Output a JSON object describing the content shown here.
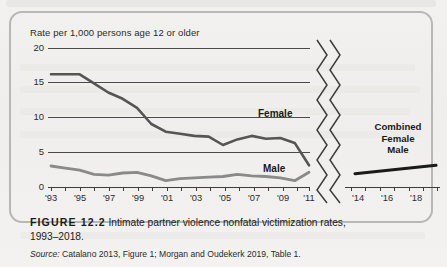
{
  "figure": {
    "number_label": "FIGURE 12.2",
    "caption": "Intimate partner violence nonfatal victimization rates, 1993–2018.",
    "source_prefix": "Source:",
    "source_text": "Catalano 2013, Figure 1; Morgan and Oudekerk 2019, Table 1."
  },
  "chart_data": {
    "type": "line",
    "title": "Intimate partner violence nonfatal victimization rates, 1993–2018",
    "ylabel": "Rate per 1,000 persons age 12 or older",
    "xlabel": "",
    "ylim": [
      0,
      20
    ],
    "yticks": [
      0,
      5,
      10,
      15,
      20
    ],
    "ytick_labels": [
      "0",
      "5",
      "10",
      "15",
      "20"
    ],
    "grid": true,
    "axis_break": true,
    "axis_break_note": "x-axis broken between 2011 and 2014",
    "xticks_left": [
      1993,
      1995,
      1997,
      1999,
      2001,
      2003,
      2005,
      2007,
      2009,
      2011
    ],
    "xtick_labels_left": [
      "'93",
      "'95",
      "'97",
      "'99",
      "'01",
      "'03",
      "'05",
      "'07",
      "'09",
      "'11"
    ],
    "xticks_right": [
      2014,
      2016,
      2018
    ],
    "xtick_labels_right": [
      "'14",
      "'16",
      "'18"
    ],
    "legend_position": "inline-right",
    "series": [
      {
        "name": "Female",
        "color": "#555555",
        "segment": "left",
        "x": [
          1993,
          1994,
          1995,
          1996,
          1997,
          1998,
          1999,
          2000,
          2001,
          2002,
          2003,
          2004,
          2005,
          2006,
          2007,
          2008,
          2009,
          2010,
          2011
        ],
        "values": [
          16.1,
          16.1,
          16.1,
          14.8,
          13.5,
          12.6,
          11.3,
          9.0,
          7.9,
          7.6,
          7.3,
          7.2,
          6.0,
          6.8,
          7.3,
          6.9,
          7.0,
          6.3,
          3.1
        ]
      },
      {
        "name": "Male",
        "color": "#8a8a8a",
        "segment": "left",
        "x": [
          1993,
          1994,
          1995,
          1996,
          1997,
          1998,
          1999,
          2000,
          2001,
          2002,
          2003,
          2004,
          2005,
          2006,
          2007,
          2008,
          2009,
          2010,
          2011
        ],
        "values": [
          3.0,
          2.7,
          2.4,
          1.8,
          1.7,
          2.0,
          2.1,
          1.6,
          0.9,
          1.2,
          1.3,
          1.4,
          1.5,
          1.8,
          1.6,
          1.5,
          1.3,
          0.9,
          2.1
        ]
      },
      {
        "name": "Combined Female Male",
        "color": "#1a1a1a",
        "segment": "right",
        "x": [
          2014,
          2018
        ],
        "values": [
          1.9,
          3.1
        ]
      }
    ],
    "annotations": [
      {
        "text": "Female",
        "x": 2009,
        "y": 8.7
      },
      {
        "text": "Male",
        "x": 2009,
        "y": 2.8
      },
      {
        "text": "Combined",
        "x": 2016,
        "y": 7.3
      },
      {
        "text": "Female",
        "x": 2016,
        "y": 6.1
      },
      {
        "text": "Male",
        "x": 2016,
        "y": 4.9
      }
    ]
  },
  "labels": {
    "female": "Female",
    "male": "Male",
    "combined_line1": "Combined",
    "combined_line2": "Female",
    "combined_line3": "Male"
  }
}
